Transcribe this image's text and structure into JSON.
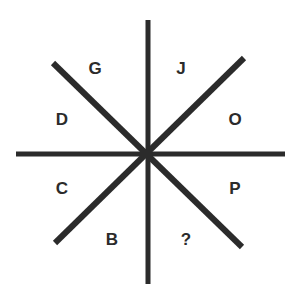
{
  "diagram": {
    "type": "letter-sequence-puzzle",
    "line_color": "#2b2b2b",
    "labels": [
      {
        "id": "G",
        "text": "G",
        "x": 95,
        "y": 70
      },
      {
        "id": "J",
        "text": "J",
        "x": 181,
        "y": 70
      },
      {
        "id": "D",
        "text": "D",
        "x": 62,
        "y": 121
      },
      {
        "id": "O",
        "text": "O",
        "x": 235,
        "y": 121
      },
      {
        "id": "C",
        "text": "C",
        "x": 62,
        "y": 190
      },
      {
        "id": "P",
        "text": "P",
        "x": 235,
        "y": 190
      },
      {
        "id": "B",
        "text": "B",
        "x": 112,
        "y": 241
      },
      {
        "id": "Q",
        "text": "?",
        "x": 186,
        "y": 241
      }
    ]
  }
}
